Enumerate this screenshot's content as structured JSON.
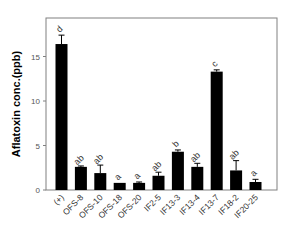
{
  "chart_data": {
    "type": "bar",
    "title": "",
    "xlabel": "",
    "ylabel": "Aflatoxin conc.(ppb)",
    "ylim": [
      0,
      18
    ],
    "yticks": [
      0,
      5,
      10,
      15
    ],
    "grid": false,
    "legend": null,
    "categories": [
      "(+)",
      "OFS-8",
      "OFS-10",
      "OFS-18",
      "OFS-20",
      "IF2-5",
      "IF13-3",
      "IF13-4",
      "IF13-7",
      "IF18-2",
      "IF20-25"
    ],
    "values": [
      16.4,
      2.6,
      1.9,
      0.8,
      0.8,
      1.6,
      4.3,
      2.6,
      13.3,
      2.2,
      0.9
    ],
    "errors": [
      1.0,
      0.1,
      0.9,
      0.0,
      0.1,
      0.4,
      0.2,
      0.4,
      0.2,
      1.1,
      0.3
    ],
    "significance_letters": [
      "d",
      "ab",
      "ab",
      "a",
      "a",
      "ab",
      "b",
      "ab",
      "c",
      "ab",
      "a"
    ],
    "bar_color": "#000000"
  }
}
